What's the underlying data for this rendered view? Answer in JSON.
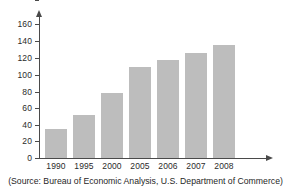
{
  "chart_data": {
    "type": "bar",
    "title": "",
    "subtitle": "",
    "xlabel": "",
    "ylabel": "",
    "categories": [
      "1990",
      "1995",
      "2000",
      "2005",
      "2006",
      "2007",
      "2008"
    ],
    "values": [
      35,
      51,
      78,
      109,
      117,
      125,
      135
    ],
    "series": [
      {
        "name": "",
        "values": [
          35,
          51,
          78,
          109,
          117,
          125,
          135
        ]
      }
    ],
    "ylim": [
      0,
      160
    ],
    "yticks": [
      "0",
      "20",
      "40",
      "60",
      "80",
      "100",
      "120",
      "140",
      "160"
    ],
    "ytick_values": [
      0,
      20,
      40,
      60,
      80,
      100,
      120,
      140,
      160
    ],
    "grid": false,
    "legend": false,
    "legend_position": "none",
    "bar_color": "#bdbdbd",
    "axis_color": "#4a4a4a",
    "text_color": "#2b2b2b"
  },
  "caption": {
    "source": "(Source: Bureau of Economic Analysis, U.S. Department of Commerce)"
  }
}
